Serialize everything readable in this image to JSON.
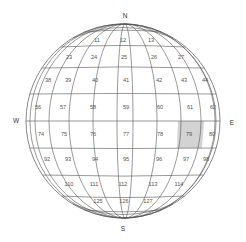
{
  "diagram": {
    "type": "globe-grid",
    "compass": {
      "north": "N",
      "south": "S",
      "east": "E",
      "west": "W"
    },
    "highlight_color": "#d3d3d3",
    "line_color": "#555555",
    "highlighted_cell": "79",
    "rows": [
      {
        "cells": [
          {
            "label": "11",
            "x": 97,
            "y": 41
          },
          {
            "label": "12",
            "x": 123,
            "y": 41
          },
          {
            "label": "13",
            "x": 151,
            "y": 41
          }
        ]
      },
      {
        "cells": [
          {
            "label": "23",
            "x": 69,
            "y": 58
          },
          {
            "label": "24",
            "x": 94,
            "y": 58
          },
          {
            "label": "25",
            "x": 124,
            "y": 58
          },
          {
            "label": "26",
            "x": 154,
            "y": 58
          },
          {
            "label": "27",
            "x": 181,
            "y": 58
          }
        ]
      },
      {
        "cells": [
          {
            "label": "38",
            "x": 48,
            "y": 81
          },
          {
            "label": "39",
            "x": 68,
            "y": 81
          },
          {
            "label": "40",
            "x": 95,
            "y": 81
          },
          {
            "label": "41",
            "x": 126,
            "y": 81
          },
          {
            "label": "42",
            "x": 159,
            "y": 81
          },
          {
            "label": "43",
            "x": 184,
            "y": 81
          },
          {
            "label": "44",
            "x": 205,
            "y": 81
          }
        ]
      },
      {
        "cells": [
          {
            "label": "56",
            "x": 38,
            "y": 108
          },
          {
            "label": "57",
            "x": 63,
            "y": 108
          },
          {
            "label": "58",
            "x": 93,
            "y": 108
          },
          {
            "label": "59",
            "x": 126,
            "y": 108
          },
          {
            "label": "60",
            "x": 160,
            "y": 108
          },
          {
            "label": "61",
            "x": 190,
            "y": 108
          },
          {
            "label": "62",
            "x": 213,
            "y": 108
          }
        ]
      },
      {
        "cells": [
          {
            "label": "74",
            "x": 41,
            "y": 135
          },
          {
            "label": "75",
            "x": 64,
            "y": 135
          },
          {
            "label": "76",
            "x": 93,
            "y": 135
          },
          {
            "label": "77",
            "x": 126,
            "y": 135
          },
          {
            "label": "78",
            "x": 160,
            "y": 135
          },
          {
            "label": "79",
            "x": 189,
            "y": 135
          },
          {
            "label": "80",
            "x": 212,
            "y": 135
          }
        ]
      },
      {
        "cells": [
          {
            "label": "92",
            "x": 47,
            "y": 160
          },
          {
            "label": "93",
            "x": 68,
            "y": 160
          },
          {
            "label": "94",
            "x": 95,
            "y": 160
          },
          {
            "label": "95",
            "x": 126,
            "y": 160
          },
          {
            "label": "96",
            "x": 159,
            "y": 160
          },
          {
            "label": "97",
            "x": 186,
            "y": 160
          },
          {
            "label": "98",
            "x": 206,
            "y": 160
          }
        ]
      },
      {
        "cells": [
          {
            "label": "110",
            "x": 69,
            "y": 185
          },
          {
            "label": "111",
            "x": 94,
            "y": 185
          },
          {
            "label": "112",
            "x": 123,
            "y": 185
          },
          {
            "label": "113",
            "x": 153,
            "y": 185
          },
          {
            "label": "114",
            "x": 179,
            "y": 185
          }
        ]
      },
      {
        "cells": [
          {
            "label": "125",
            "x": 98,
            "y": 202
          },
          {
            "label": "126",
            "x": 124,
            "y": 202
          },
          {
            "label": "127",
            "x": 148,
            "y": 202
          }
        ]
      }
    ]
  }
}
